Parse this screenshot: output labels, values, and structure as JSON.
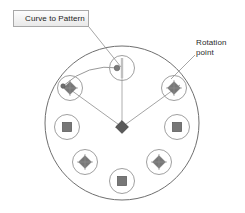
{
  "figure": {
    "type": "cad-circular-pattern-diagram",
    "background_color": "#ffffff",
    "width": 245,
    "height": 213
  },
  "callouts": {
    "curve_to_pattern": {
      "label": "Curve to Pattern",
      "style": "boxed-tooltip",
      "box_fill": "#f2f2f2",
      "box_border": "#a8a8a8",
      "text_color": "#1b1b1b",
      "box": {
        "x": 13,
        "y": 10,
        "w": 76,
        "h": 17
      },
      "leader_from": {
        "x": 89,
        "y": 27
      },
      "leader_to": {
        "x": 120,
        "y": 66
      }
    },
    "rotation_point": {
      "label_line1": "Rotation",
      "label_line2": "point",
      "style": "plain-text",
      "text_color": "#2a2a2a",
      "text_origin": {
        "x": 196,
        "y": 38
      },
      "leader_from": {
        "x": 193,
        "y": 55
      },
      "leader_to": {
        "x": 168,
        "y": 78
      }
    }
  },
  "geometry": {
    "outline_circle": {
      "name": "pattern-body-outline",
      "cx": 122,
      "cy": 123,
      "r": 77,
      "stroke": "#6f6f6f",
      "stroke_width": 1,
      "fill": "none"
    },
    "rotation_hub": {
      "name": "rotation-point-marker",
      "cx": 122,
      "cy": 127,
      "size": 7,
      "shape": "diamond",
      "fill": "#5a5a5a",
      "stroke": "#3a3a3a"
    },
    "seed_handle": {
      "name": "seed-instance-handle",
      "cx": 117,
      "cy": 68,
      "r": 2.6,
      "fill": "#7a7a7a"
    },
    "arc_curve": {
      "name": "pattern-guide-arc",
      "stroke": "#8d8d8d",
      "stroke_width": 0.9,
      "path": "M 63,86 Q 88,64 119,68"
    },
    "radial_lines": {
      "stroke": "#9a9a9a",
      "stroke_width": 0.8,
      "lines": [
        {
          "name": "radial-line-to-top",
          "x1": 122,
          "y1": 127,
          "x2": 122,
          "y2": 64
        },
        {
          "name": "radial-line-to-upper-left",
          "x1": 122,
          "y1": 127,
          "x2": 64,
          "y2": 85
        },
        {
          "name": "radial-line-to-upper-right",
          "x1": 122,
          "y1": 127,
          "x2": 180,
          "y2": 85
        }
      ]
    },
    "instances": [
      {
        "name": "pattern-instance-top",
        "cx": 122,
        "cy": 68,
        "r": 12.5,
        "marker": "line-through-circle",
        "marker_color": "#b3b3b3"
      },
      {
        "name": "pattern-instance-upper-left",
        "cx": 70,
        "cy": 88,
        "r": 12.5,
        "marker": "diamond",
        "marker_color": "#707070"
      },
      {
        "name": "pattern-instance-upper-right",
        "cx": 174,
        "cy": 88,
        "r": 12.5,
        "marker": "diamond",
        "marker_color": "#707070"
      },
      {
        "name": "pattern-instance-left",
        "cx": 67,
        "cy": 127,
        "r": 12.5,
        "marker": "square",
        "marker_color": "#707070"
      },
      {
        "name": "pattern-instance-right",
        "cx": 177,
        "cy": 127,
        "r": 12.5,
        "marker": "square",
        "marker_color": "#707070"
      },
      {
        "name": "pattern-instance-lower-left",
        "cx": 85,
        "cy": 162,
        "r": 12.5,
        "marker": "diamond",
        "marker_color": "#707070"
      },
      {
        "name": "pattern-instance-lower-right",
        "cx": 159,
        "cy": 162,
        "r": 12.5,
        "marker": "diamond",
        "marker_color": "#707070"
      },
      {
        "name": "pattern-instance-bottom",
        "cx": 122,
        "cy": 181,
        "r": 12.5,
        "marker": "square",
        "marker_color": "#707070"
      }
    ],
    "instance_circle_stroke": "#a0a0a0",
    "leader_stroke": "#9a9a9a"
  }
}
